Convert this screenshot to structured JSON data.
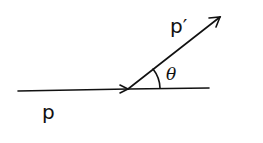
{
  "diagram": {
    "labels": {
      "incoming_momentum": "p",
      "outgoing_momentum": "p′",
      "angle": "θ"
    },
    "colors": {
      "stroke": "#111111",
      "background": "#ffffff"
    }
  }
}
